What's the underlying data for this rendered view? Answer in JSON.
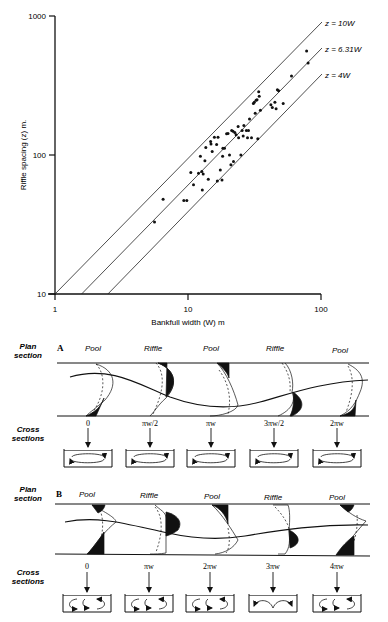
{
  "chart_data": {
    "type": "scatter",
    "title": "",
    "xlabel": "Bankfull width (W) m",
    "ylabel": "Riffle spacing (z) m.",
    "xscale": "log",
    "yscale": "log",
    "xlim": [
      1,
      100
    ],
    "ylim": [
      10,
      1000
    ],
    "xticks": [
      "1",
      "10",
      "100"
    ],
    "yticks": [
      "10",
      "100",
      "1000"
    ],
    "grid": false,
    "legend": null,
    "reference_lines": [
      {
        "label": "z = 10W",
        "slope": 10
      },
      {
        "label": "z = 6.31W",
        "slope": 6.31
      },
      {
        "label": "z = 4W",
        "slope": 4
      }
    ],
    "points": [
      [
        5.6,
        33
      ],
      [
        6.5,
        48
      ],
      [
        9.3,
        47
      ],
      [
        9.8,
        47
      ],
      [
        10.5,
        75
      ],
      [
        11,
        61
      ],
      [
        12,
        74
      ],
      [
        12.4,
        98
      ],
      [
        12.7,
        76
      ],
      [
        12.8,
        56
      ],
      [
        13,
        73
      ],
      [
        13.4,
        91
      ],
      [
        13.6,
        113
      ],
      [
        14.2,
        67
      ],
      [
        14.8,
        125
      ],
      [
        14.9,
        120
      ],
      [
        15.2,
        106
      ],
      [
        15.8,
        134
      ],
      [
        16.4,
        119
      ],
      [
        16.6,
        65
      ],
      [
        16.8,
        134
      ],
      [
        17.5,
        78
      ],
      [
        18,
        66
      ],
      [
        18.2,
        98
      ],
      [
        18.3,
        112
      ],
      [
        18.8,
        112
      ],
      [
        19.5,
        142
      ],
      [
        20,
        143
      ],
      [
        20.5,
        100
      ],
      [
        21,
        85
      ],
      [
        21.3,
        150
      ],
      [
        21.8,
        148
      ],
      [
        22,
        90
      ],
      [
        22.5,
        145
      ],
      [
        23,
        140
      ],
      [
        23.8,
        160
      ],
      [
        24,
        133
      ],
      [
        25,
        100
      ],
      [
        25.5,
        150
      ],
      [
        26,
        137
      ],
      [
        26.3,
        163
      ],
      [
        27.5,
        150
      ],
      [
        28,
        133
      ],
      [
        28.5,
        150
      ],
      [
        29,
        182
      ],
      [
        30,
        133
      ],
      [
        31,
        235
      ],
      [
        31.5,
        240
      ],
      [
        32,
        200
      ],
      [
        32.5,
        248
      ],
      [
        33,
        250
      ],
      [
        33.5,
        131
      ],
      [
        34,
        285
      ],
      [
        34.3,
        265
      ],
      [
        35,
        210
      ],
      [
        42,
        230
      ],
      [
        43,
        220
      ],
      [
        45,
        240
      ],
      [
        46,
        215
      ],
      [
        47,
        295
      ],
      [
        48,
        290
      ],
      [
        52,
        235
      ],
      [
        60,
        370
      ],
      [
        78,
        560
      ],
      [
        80,
        460
      ]
    ]
  },
  "panels": {
    "plan_label_line1": "Plan",
    "plan_label_line2": "section",
    "cross_label_line1": "Cross",
    "cross_label_line2": "sections",
    "A": {
      "letter": "A",
      "reaches": [
        "Pool",
        "Riffle",
        "Pool",
        "Riffle",
        "Pool"
      ],
      "positions": [
        "0",
        "πw/2",
        "πw",
        "3πw/2",
        "2πw"
      ]
    },
    "B": {
      "letter": "B",
      "reaches": [
        "Pool",
        "Riffle",
        "Pool",
        "Riffle",
        "Pool"
      ],
      "positions": [
        "0",
        "πw",
        "2πw",
        "3πw",
        "4πw"
      ]
    }
  }
}
